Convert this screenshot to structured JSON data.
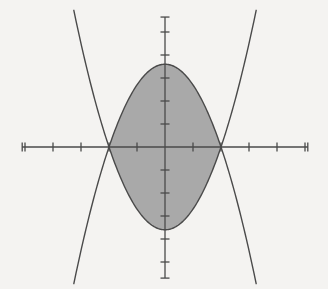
{
  "figure": {
    "name": "region-bounded-by-two-parabolas",
    "background_color": "#f4f3f1",
    "width": 328,
    "height": 289
  },
  "chart_data": {
    "type": "line",
    "title": "",
    "subtitle": "",
    "xlabel": "",
    "ylabel": "",
    "grid": false,
    "legend": null,
    "legend_position": "none",
    "axis_style": "centered-cross-with-ticks",
    "origin_px": [
      165,
      147
    ],
    "px_per_unit_x": 28,
    "px_per_unit_y": 23,
    "xlim": [
      -5.1,
      5.1
    ],
    "ylim": [
      -5.7,
      5.65
    ],
    "xticks": [
      -5,
      -4,
      -3,
      -2,
      -1,
      0,
      1,
      2,
      3,
      4,
      5
    ],
    "yticks": [
      -5,
      -4,
      -3,
      -2,
      -1,
      0,
      1,
      2,
      3,
      4,
      5
    ],
    "xtick_labels": [
      "",
      "",
      "",
      "",
      "",
      "",
      "",
      "",
      "",
      "",
      ""
    ],
    "ytick_labels": [
      "",
      "",
      "",
      "",
      "",
      "",
      "",
      "",
      "",
      "",
      ""
    ],
    "tick_length_px": 9,
    "axis_color": "#4a4a4a",
    "curve_color": "#4a4a4a",
    "curve_width_px": 1.4,
    "fill_color": "#a9a9a9",
    "fill_opacity": 1,
    "series": [
      {
        "name": "downward-parabola",
        "equation": "y = 3.6 - 0.9 x^2",
        "color": "#4a4a4a",
        "x": [
          -3.1,
          -2.8,
          -2.5,
          -2.2,
          -2.0,
          -1.7,
          -1.4,
          -1.1,
          -0.8,
          -0.5,
          -0.2,
          0.0,
          0.2,
          0.5,
          0.8,
          1.1,
          1.4,
          1.7,
          2.0,
          2.2,
          2.5,
          2.8,
          3.1
        ],
        "y": [
          -5.05,
          -3.46,
          -2.03,
          -0.76,
          0.0,
          1.0,
          1.84,
          2.51,
          3.02,
          3.38,
          3.56,
          3.6,
          3.56,
          3.38,
          3.02,
          2.51,
          1.84,
          1.0,
          0.0,
          -0.76,
          -2.03,
          -3.46,
          -5.05
        ]
      },
      {
        "name": "upward-parabola",
        "equation": "y = -3.6 + 0.9 x^2",
        "color": "#4a4a4a",
        "x": [
          -3.1,
          -2.8,
          -2.5,
          -2.2,
          -2.0,
          -1.7,
          -1.4,
          -1.1,
          -0.8,
          -0.5,
          -0.2,
          0.0,
          0.2,
          0.5,
          0.8,
          1.1,
          1.4,
          1.7,
          2.0,
          2.2,
          2.5,
          2.8,
          3.1
        ],
        "y": [
          5.05,
          3.46,
          2.03,
          0.76,
          0.0,
          -1.0,
          -1.84,
          -2.51,
          -3.02,
          -3.38,
          -3.56,
          -3.6,
          -3.56,
          -3.38,
          -3.02,
          -2.51,
          -1.84,
          -1.0,
          0.0,
          0.76,
          2.03,
          3.46,
          5.05
        ]
      }
    ],
    "shaded_region": {
      "name": "enclosed-region",
      "description": "Region enclosed between the upward and downward parabolas",
      "fill_color": "#a9a9a9",
      "intersections": [
        [
          -2.0,
          0.0
        ],
        [
          2.0,
          0.0
        ]
      ],
      "top_vertex": [
        0.0,
        3.6
      ],
      "bottom_vertex": [
        0.0,
        -3.6
      ],
      "widest_y": 0.0
    },
    "annotations": []
  }
}
